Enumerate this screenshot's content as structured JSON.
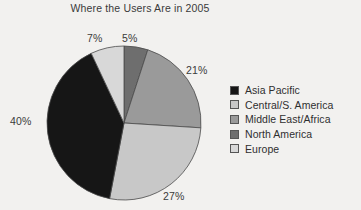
{
  "chart_data": {
    "type": "pie",
    "title": "Where the Users Are in 2005",
    "xlabel": "",
    "ylabel": "",
    "legend_position": "right",
    "grid": false,
    "start_angle_deg": 0,
    "direction": "clockwise",
    "categories": [
      "North America",
      "Middle East/Africa",
      "Central/S. America",
      "Asia Pacific",
      "Europe"
    ],
    "values": [
      5,
      21,
      27,
      40,
      7
    ],
    "value_labels": [
      "5%",
      "21%",
      "27%",
      "40%",
      "7%"
    ],
    "colors": [
      "#6e6e6e",
      "#9a9a9a",
      "#c8c8c8",
      "#161616",
      "#d8d8d8"
    ],
    "slices": [
      {
        "label": "North America",
        "value": 5,
        "display": "5%",
        "color": "#6e6e6e"
      },
      {
        "label": "Middle East/Africa",
        "value": 21,
        "display": "21%",
        "color": "#9a9a9a"
      },
      {
        "label": "Central/S. America",
        "value": 27,
        "display": "27%",
        "color": "#c8c8c8"
      },
      {
        "label": "Asia Pacific",
        "value": 40,
        "display": "40%",
        "color": "#161616"
      },
      {
        "label": "Europe",
        "value": 7,
        "display": "7%",
        "color": "#d8d8d8"
      }
    ]
  },
  "legend": {
    "items": [
      {
        "label": "Asia Pacific",
        "color": "#161616"
      },
      {
        "label": "Central/S. America",
        "color": "#c8c8c8"
      },
      {
        "label": "Middle East/Africa",
        "color": "#9a9a9a"
      },
      {
        "label": "North America",
        "color": "#6e6e6e"
      },
      {
        "label": "Europe",
        "color": "#d8d8d8"
      }
    ]
  },
  "geometry": {
    "center_x": 124,
    "center_y": 123,
    "radius": 77
  }
}
